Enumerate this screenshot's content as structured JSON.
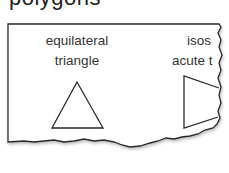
{
  "heading": "polygons",
  "cards": [
    {
      "line1": "equilateral",
      "line2": "triangle",
      "shape": "equilateral-triangle"
    },
    {
      "line1": "isos",
      "line2": "acute t",
      "shape": "isosceles-acute-triangle-partial"
    }
  ],
  "colors": {
    "stroke": "#2a2a2a",
    "text": "#333333",
    "background": "#ffffff"
  }
}
